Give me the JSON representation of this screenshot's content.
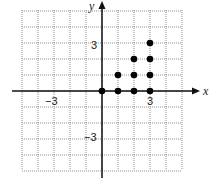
{
  "chart_data": {
    "type": "scatter",
    "title": "",
    "xlabel": "x",
    "ylabel": "y",
    "xlim": [
      -5,
      5
    ],
    "ylim": [
      -5,
      5
    ],
    "grid": true,
    "tick_labels": {
      "x": [
        "-3",
        "3"
      ],
      "y": [
        "3",
        "-3"
      ]
    },
    "points": [
      {
        "x": 0,
        "y": 0
      },
      {
        "x": 1,
        "y": 0
      },
      {
        "x": 2,
        "y": 0
      },
      {
        "x": 3,
        "y": 0
      },
      {
        "x": 1,
        "y": 1
      },
      {
        "x": 2,
        "y": 1
      },
      {
        "x": 3,
        "y": 1
      },
      {
        "x": 2,
        "y": 2
      },
      {
        "x": 3,
        "y": 2
      },
      {
        "x": 3,
        "y": 3
      }
    ]
  },
  "labels": {
    "x_axis": "x",
    "y_axis": "y",
    "x_neg": "−3",
    "x_pos": "3",
    "y_pos": "3",
    "y_neg": "−3"
  }
}
